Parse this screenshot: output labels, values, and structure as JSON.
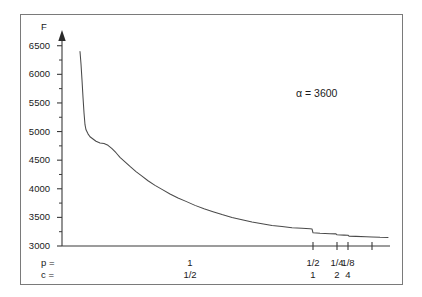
{
  "figure": {
    "axis_title_y": "F",
    "annotation": "α = 3600",
    "row_head_p": "p =",
    "row_head_c": "c ="
  },
  "chart_data": {
    "type": "line",
    "title": "",
    "xlabel": "",
    "ylabel": "F",
    "ylim": [
      3000,
      6600
    ],
    "grid": false,
    "legend": null,
    "annotations": [
      "α = 3600"
    ],
    "yticks": [
      3000,
      3500,
      4000,
      4500,
      5000,
      5500,
      6000,
      6500
    ],
    "ytick_labels": [
      "3000",
      "3500",
      "4000",
      "4500",
      "5000",
      "5500",
      "6000",
      "6500"
    ],
    "yminor_step": 250,
    "x_axis_rows": [
      {
        "name": "p",
        "head": "p =",
        "labels": [
          "1",
          "1/2",
          "1/4",
          "1/8"
        ]
      },
      {
        "name": "c",
        "head": "c =",
        "labels": [
          "1/2",
          "1",
          "2",
          "4"
        ]
      }
    ],
    "xticks_px": [
      313,
      337,
      348,
      372
    ],
    "xtick_pairs": [
      {
        "p": "1/2",
        "c": "1"
      },
      {
        "p": "1/4",
        "c": "2"
      },
      {
        "p": "1/8",
        "c": "4"
      }
    ],
    "mid_label_pair": {
      "p": "1",
      "c": "1/2",
      "x_px": 190
    },
    "series": [
      {
        "name": "F",
        "points_px_value": [
          [
            80,
            6400
          ],
          [
            81,
            6180
          ],
          [
            82,
            5900
          ],
          [
            83,
            5600
          ],
          [
            84,
            5330
          ],
          [
            85,
            5120
          ],
          [
            86,
            5030
          ],
          [
            88,
            4960
          ],
          [
            90,
            4910
          ],
          [
            93,
            4870
          ],
          [
            96,
            4830
          ],
          [
            100,
            4800
          ],
          [
            104,
            4790
          ],
          [
            108,
            4760
          ],
          [
            112,
            4700
          ],
          [
            116,
            4630
          ],
          [
            120,
            4550
          ],
          [
            125,
            4470
          ],
          [
            130,
            4390
          ],
          [
            136,
            4300
          ],
          [
            142,
            4220
          ],
          [
            148,
            4140
          ],
          [
            155,
            4060
          ],
          [
            162,
            3990
          ],
          [
            170,
            3910
          ],
          [
            178,
            3840
          ],
          [
            186,
            3780
          ],
          [
            195,
            3710
          ],
          [
            204,
            3650
          ],
          [
            213,
            3600
          ],
          [
            222,
            3550
          ],
          [
            232,
            3500
          ],
          [
            242,
            3460
          ],
          [
            252,
            3420
          ],
          [
            262,
            3390
          ],
          [
            272,
            3360
          ],
          [
            282,
            3340
          ],
          [
            292,
            3320
          ],
          [
            302,
            3310
          ],
          [
            310,
            3300
          ],
          [
            312,
            3298
          ],
          [
            313,
            3230
          ],
          [
            320,
            3222
          ],
          [
            330,
            3215
          ],
          [
            336,
            3212
          ],
          [
            337,
            3195
          ],
          [
            344,
            3190
          ],
          [
            348,
            3188
          ],
          [
            349,
            3172
          ],
          [
            356,
            3168
          ],
          [
            366,
            3162
          ],
          [
            372,
            3158
          ],
          [
            380,
            3152
          ],
          [
            388,
            3150
          ]
        ]
      }
    ]
  }
}
